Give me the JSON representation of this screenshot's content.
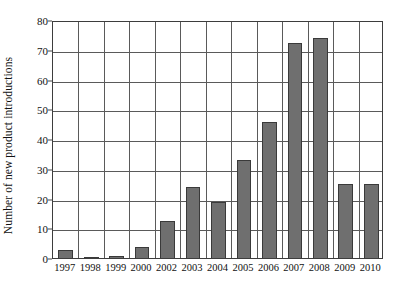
{
  "chart_data": {
    "type": "bar",
    "title": "",
    "xlabel": "",
    "ylabel": "Number of new product introductions",
    "categories": [
      "1997",
      "1998",
      "1999",
      "2000",
      "2002",
      "2003",
      "2004",
      "2005",
      "2006",
      "2007",
      "2008",
      "2009",
      "2010"
    ],
    "values": [
      3.5,
      1,
      1.5,
      4.5,
      13,
      24.5,
      19.5,
      33.5,
      46.5,
      73,
      74.5,
      25.5,
      25.5
    ],
    "ylim": [
      0,
      80
    ],
    "yticks": [
      0,
      10,
      20,
      30,
      40,
      50,
      60,
      70,
      80
    ],
    "ytick_labels": [
      "0",
      "10",
      "20",
      "30",
      "40",
      "50",
      "60",
      "70",
      "80"
    ],
    "grid": "both",
    "legend": "none",
    "bar_color": "#6f6f6f",
    "bar_edge_color": "#3a3a3a",
    "axis_color": "#3d3d3d",
    "grid_color": "#5a5a5a",
    "background_color": "#ffffff"
  }
}
